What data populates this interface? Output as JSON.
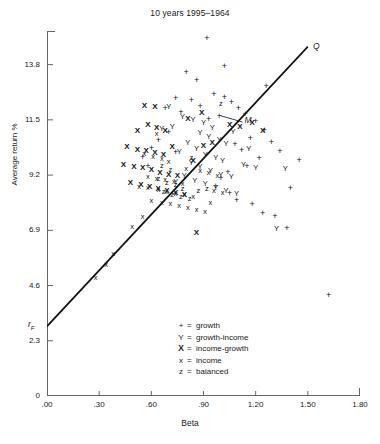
{
  "chart_data": {
    "type": "scatter",
    "title": "10 years 1995–1964",
    "xlabel": "Beta",
    "ylabel": "Average return %",
    "xlim": [
      0,
      1.8
    ],
    "ylim": [
      0,
      15.2
    ],
    "xticks": [
      ".00",
      ".30",
      ".60",
      ".90",
      "1.20",
      "1.50",
      "1.80"
    ],
    "xtick_values": [
      0,
      0.3,
      0.6,
      0.9,
      1.2,
      1.5,
      1.8
    ],
    "yticks": [
      "0",
      "2.3",
      "4.6",
      "6.9",
      "9.2",
      "11.5",
      "13.8"
    ],
    "ytick_values": [
      0,
      2.3,
      4.6,
      6.9,
      9.2,
      11.5,
      13.8
    ],
    "grid": false,
    "legend_position": "inside-bottom-center",
    "legend": [
      {
        "symbol": "+",
        "style": "plus",
        "label": "growth"
      },
      {
        "symbol": "Y",
        "style": "Y",
        "label": "growth-income"
      },
      {
        "symbol": "X",
        "style": "Xb",
        "label": "income-growth"
      },
      {
        "symbol": "x",
        "style": "x",
        "label": "income"
      },
      {
        "symbol": "z",
        "style": "z",
        "label": "balanced"
      }
    ],
    "annotations": [
      {
        "name": "Q",
        "text": "Q",
        "beta": 1.53,
        "ret": 14.55
      },
      {
        "name": "M",
        "text": "M",
        "beta": 1.09,
        "ret": 11.45
      },
      {
        "name": "rF",
        "text": "r",
        "sub": "F",
        "beta": -0.055,
        "ret": 2.95
      }
    ],
    "line": {
      "name": "security-market-line",
      "x0": 0.0,
      "y0": 2.9,
      "x1": 1.5,
      "y1": 14.55,
      "label_start": "rF",
      "label_end": "Q"
    },
    "series": [
      {
        "name": "growth",
        "symbol": "+",
        "points": [
          [
            0.92,
            14.85
          ],
          [
            0.8,
            13.45
          ],
          [
            0.86,
            13.1
          ],
          [
            0.74,
            12.35
          ],
          [
            0.83,
            12.28
          ],
          [
            0.68,
            11.95
          ],
          [
            0.77,
            11.8
          ],
          [
            0.88,
            12.02
          ],
          [
            0.96,
            12.55
          ],
          [
            1.02,
            12.4
          ],
          [
            1.06,
            12.2
          ],
          [
            0.99,
            11.62
          ],
          [
            0.93,
            11.5
          ],
          [
            1.1,
            11.95
          ],
          [
            1.14,
            11.72
          ],
          [
            1.2,
            11.4
          ],
          [
            1.25,
            11.05
          ],
          [
            1.17,
            10.7
          ],
          [
            1.08,
            10.45
          ],
          [
            1.12,
            10.2
          ],
          [
            0.7,
            10.95
          ],
          [
            0.64,
            10.6
          ],
          [
            0.6,
            10.3
          ],
          [
            0.74,
            10.1
          ],
          [
            1.29,
            10.55
          ],
          [
            1.34,
            10.18
          ],
          [
            1.22,
            9.85
          ],
          [
            1.15,
            9.55
          ],
          [
            1.04,
            9.3
          ],
          [
            1.0,
            9.05
          ],
          [
            0.97,
            8.72
          ],
          [
            1.05,
            8.4
          ],
          [
            1.09,
            8.1
          ],
          [
            1.18,
            7.95
          ],
          [
            1.24,
            7.6
          ],
          [
            1.31,
            7.45
          ],
          [
            1.45,
            9.8
          ],
          [
            1.4,
            8.6
          ],
          [
            1.62,
            4.15
          ],
          [
            1.38,
            6.95
          ],
          [
            0.55,
            9.9
          ],
          [
            0.58,
            9.55
          ],
          [
            1.02,
            13.72
          ],
          [
            1.26,
            12.85
          ]
        ]
      },
      {
        "name": "growth-income",
        "symbol": "Y",
        "points": [
          [
            0.78,
            11.62
          ],
          [
            0.84,
            11.48
          ],
          [
            0.9,
            11.35
          ],
          [
            0.95,
            11.18
          ],
          [
            0.72,
            11.22
          ],
          [
            0.88,
            10.95
          ],
          [
            0.93,
            10.8
          ],
          [
            0.99,
            10.65
          ],
          [
            1.03,
            10.5
          ],
          [
            0.81,
            10.55
          ],
          [
            0.86,
            10.3
          ],
          [
            0.76,
            10.18
          ],
          [
            0.91,
            10.05
          ],
          [
            0.97,
            9.92
          ],
          [
            1.01,
            9.78
          ],
          [
            0.83,
            9.7
          ],
          [
            0.88,
            9.52
          ],
          [
            0.94,
            9.38
          ],
          [
            1.0,
            9.22
          ],
          [
            1.06,
            9.1
          ],
          [
            0.79,
            9.18
          ],
          [
            0.85,
            8.95
          ],
          [
            0.91,
            8.82
          ],
          [
            0.97,
            8.68
          ],
          [
            1.03,
            8.55
          ],
          [
            0.74,
            8.9
          ],
          [
            1.09,
            8.42
          ],
          [
            1.13,
            9.6
          ],
          [
            1.2,
            9.5
          ],
          [
            1.37,
            9.45
          ],
          [
            1.32,
            6.95
          ],
          [
            1.07,
            10.98
          ],
          [
            0.66,
            11.1
          ],
          [
            1.16,
            10.28
          ],
          [
            0.7,
            12.05
          ]
        ]
      },
      {
        "name": "income-growth",
        "symbol": "X",
        "points": [
          [
            0.52,
            11.05
          ],
          [
            0.58,
            11.3
          ],
          [
            0.63,
            11.18
          ],
          [
            0.68,
            11.05
          ],
          [
            0.46,
            10.35
          ],
          [
            0.52,
            10.25
          ],
          [
            0.57,
            10.2
          ],
          [
            0.62,
            10.12
          ],
          [
            0.67,
            10.02
          ],
          [
            0.72,
            10.35
          ],
          [
            0.44,
            9.62
          ],
          [
            0.5,
            9.55
          ],
          [
            0.55,
            9.48
          ],
          [
            0.6,
            9.4
          ],
          [
            0.65,
            9.3
          ],
          [
            0.7,
            9.22
          ],
          [
            0.75,
            9.15
          ],
          [
            0.48,
            8.85
          ],
          [
            0.54,
            8.78
          ],
          [
            0.59,
            8.7
          ],
          [
            0.64,
            8.62
          ],
          [
            0.69,
            8.55
          ],
          [
            0.74,
            8.45
          ],
          [
            0.79,
            8.38
          ],
          [
            0.84,
            9.8
          ],
          [
            0.9,
            10.42
          ],
          [
            0.95,
            10.52
          ],
          [
            1.05,
            11.3
          ],
          [
            1.11,
            11.22
          ],
          [
            1.18,
            11.35
          ],
          [
            1.24,
            11.02
          ],
          [
            0.86,
            6.78
          ],
          [
            0.56,
            12.08
          ],
          [
            0.62,
            12.02
          ],
          [
            0.81,
            11.55
          ],
          [
            0.89,
            11.78
          ]
        ]
      },
      {
        "name": "income",
        "symbol": "x",
        "points": [
          [
            0.63,
            10.9
          ],
          [
            0.56,
            10.08
          ],
          [
            0.61,
            9.95
          ],
          [
            0.66,
            9.88
          ],
          [
            0.7,
            9.75
          ],
          [
            0.58,
            9.12
          ],
          [
            0.63,
            9.05
          ],
          [
            0.68,
            8.98
          ],
          [
            0.73,
            8.9
          ],
          [
            0.78,
            8.82
          ],
          [
            0.53,
            8.72
          ],
          [
            0.58,
            8.65
          ],
          [
            0.64,
            8.58
          ],
          [
            0.69,
            8.5
          ],
          [
            0.74,
            8.42
          ],
          [
            0.79,
            8.35
          ],
          [
            0.84,
            8.28
          ],
          [
            0.6,
            8.12
          ],
          [
            0.66,
            8.05
          ],
          [
            0.71,
            7.98
          ],
          [
            0.76,
            7.9
          ],
          [
            0.81,
            7.82
          ],
          [
            0.86,
            7.75
          ],
          [
            0.91,
            7.68
          ],
          [
            0.55,
            7.45
          ],
          [
            0.49,
            7.05
          ],
          [
            0.38,
            5.9
          ],
          [
            0.28,
            4.92
          ],
          [
            0.34,
            5.45
          ],
          [
            0.88,
            9.35
          ],
          [
            0.93,
            9.28
          ],
          [
            0.98,
            9.18
          ],
          [
            0.96,
            8.55
          ],
          [
            1.01,
            8.45
          ],
          [
            0.94,
            8.02
          ],
          [
            0.8,
            9.45
          ]
        ]
      },
      {
        "name": "balanced",
        "symbol": "z",
        "points": [
          [
            0.66,
            9.58
          ],
          [
            0.71,
            9.42
          ],
          [
            0.64,
            9.05
          ],
          [
            0.69,
            8.88
          ],
          [
            0.74,
            8.78
          ],
          [
            0.67,
            8.48
          ],
          [
            0.72,
            8.35
          ],
          [
            0.77,
            8.28
          ],
          [
            0.82,
            8.22
          ],
          [
            0.87,
            8.52
          ],
          [
            0.92,
            8.62
          ],
          [
            1.0,
            12.18
          ],
          [
            0.83,
            9.92
          ],
          [
            0.78,
            8.62
          ]
        ]
      }
    ]
  }
}
